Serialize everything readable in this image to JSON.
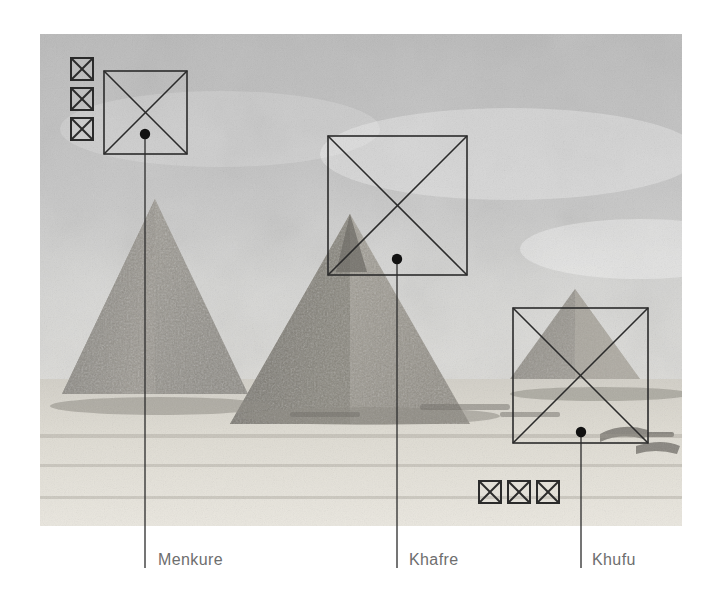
{
  "figure": {
    "title_visible": false,
    "background_color": "#ffffff",
    "annotation_color": "#2b2b2b",
    "label_color": "#6e6e6e",
    "photo": {
      "name": "giza-pyramids-photograph",
      "subject": "Three pyramids of Giza in grayscale",
      "x": 40,
      "y": 34,
      "width": 642,
      "height": 492,
      "tone": "grayscale"
    }
  },
  "icon_groups": [
    {
      "name": "top-left-square-stack",
      "orientation": "vertical",
      "count": 3,
      "glyph": "crossed-square",
      "squares": [
        {
          "x": 71,
          "y": 58,
          "size": 22
        },
        {
          "x": 71,
          "y": 88,
          "size": 22
        },
        {
          "x": 71,
          "y": 118,
          "size": 22
        }
      ]
    },
    {
      "name": "bottom-square-row",
      "orientation": "horizontal",
      "count": 3,
      "glyph": "crossed-square",
      "squares": [
        {
          "x": 479,
          "y": 481,
          "size": 22
        },
        {
          "x": 508,
          "y": 481,
          "size": 22
        },
        {
          "x": 537,
          "y": 481,
          "size": 22
        }
      ]
    }
  ],
  "markers": [
    {
      "id": "menkure",
      "label": "Menkure",
      "square": {
        "x": 104,
        "y": 71,
        "size": 83
      },
      "dot": {
        "cx": 145,
        "cy": 134,
        "r": 5
      },
      "leader_line": {
        "x": 145,
        "y1": 139,
        "y2": 568
      },
      "label_position": {
        "x": 158,
        "y": 552
      }
    },
    {
      "id": "khafre",
      "label": "Khafre",
      "square": {
        "x": 328,
        "y": 136,
        "size": 139
      },
      "dot": {
        "cx": 397,
        "cy": 259,
        "r": 5
      },
      "leader_line": {
        "x": 397,
        "y1": 264,
        "y2": 568
      },
      "label_position": {
        "x": 409,
        "y": 552
      }
    },
    {
      "id": "khufu",
      "label": "Khufu",
      "square": {
        "x": 513,
        "y": 308,
        "size": 135
      },
      "dot": {
        "cx": 581,
        "cy": 432,
        "r": 5
      },
      "leader_line": {
        "x": 581,
        "y1": 437,
        "y2": 568
      },
      "label_position": {
        "x": 592,
        "y": 552
      }
    }
  ]
}
